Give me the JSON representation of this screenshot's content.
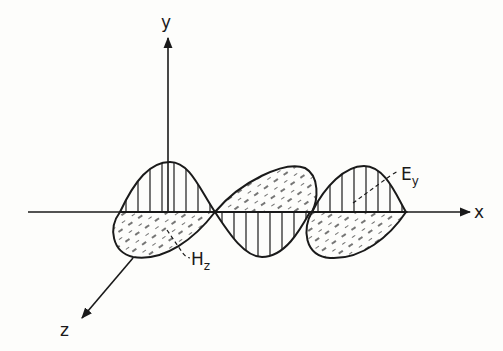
{
  "diagram": {
    "axes": {
      "x_label": "x",
      "y_label": "y",
      "z_label": "z"
    },
    "fields": {
      "electric": {
        "symbol": "E",
        "subscript": "y",
        "plane": "xy",
        "hatch": "vertical lines"
      },
      "magnetic": {
        "symbol": "H",
        "subscript": "z",
        "plane": "xz",
        "hatch": "dashed diagonal"
      }
    },
    "colors": {
      "ink": "#1a1a1a",
      "background": "#fdfdfb"
    }
  }
}
